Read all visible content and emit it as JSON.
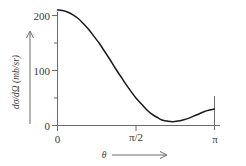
{
  "chart_data": {
    "type": "line",
    "title": "",
    "subtitle": "",
    "xlabel": "θ",
    "ylabel": "dσ/dΩ (mb/sr)",
    "ylabel_parts": {
      "numerator": "dσ",
      "denominator": "dΩ",
      "units": "(mb/sr)",
      "composed": "dσ/dΩ (mb/sr)"
    },
    "xlim": [
      0,
      3.14159
    ],
    "ylim": [
      0,
      215
    ],
    "x_tick_labels": [
      "0",
      "π/2",
      "π"
    ],
    "x_tick_values": [
      0,
      1.5708,
      3.14159
    ],
    "x_minor_ticks": [],
    "y_tick_labels": [
      "0",
      "100",
      "200"
    ],
    "y_tick_values": [
      0,
      100,
      200
    ],
    "y_minor_tick_values": [
      50,
      150
    ],
    "grid": false,
    "legend": null,
    "legend_position": "none",
    "annotations": [],
    "axis_arrow_x": true,
    "axis_arrow_y": true,
    "right_boundary_line": true,
    "series": [
      {
        "name": "dσ/dΩ",
        "color": "#1a1a1a",
        "x": [
          0.0,
          0.1,
          0.21,
          0.31,
          0.42,
          0.52,
          0.63,
          0.73,
          0.84,
          0.94,
          1.05,
          1.15,
          1.26,
          1.36,
          1.47,
          1.57,
          1.68,
          1.78,
          1.88,
          1.99,
          2.09,
          2.2,
          2.3,
          2.41,
          2.51,
          2.62,
          2.72,
          2.83,
          2.93,
          3.04,
          3.14
        ],
        "values": [
          210,
          209,
          206,
          201,
          194,
          185,
          174,
          162,
          149,
          135,
          120,
          105,
          90,
          76,
          62,
          50,
          39,
          29,
          21,
          15,
          10,
          8,
          7,
          8,
          10,
          13,
          17,
          21,
          25,
          28,
          30
        ],
        "y_start": 210,
        "y_min": 7,
        "y_min_at_x": 2.3,
        "y_end": 30
      }
    ]
  },
  "figure": {
    "caption": "",
    "background": "#ffffff",
    "curve_color": "#1a1a1a",
    "axis_color": "#6b6b6b",
    "text_color": "#3a3a3a"
  }
}
